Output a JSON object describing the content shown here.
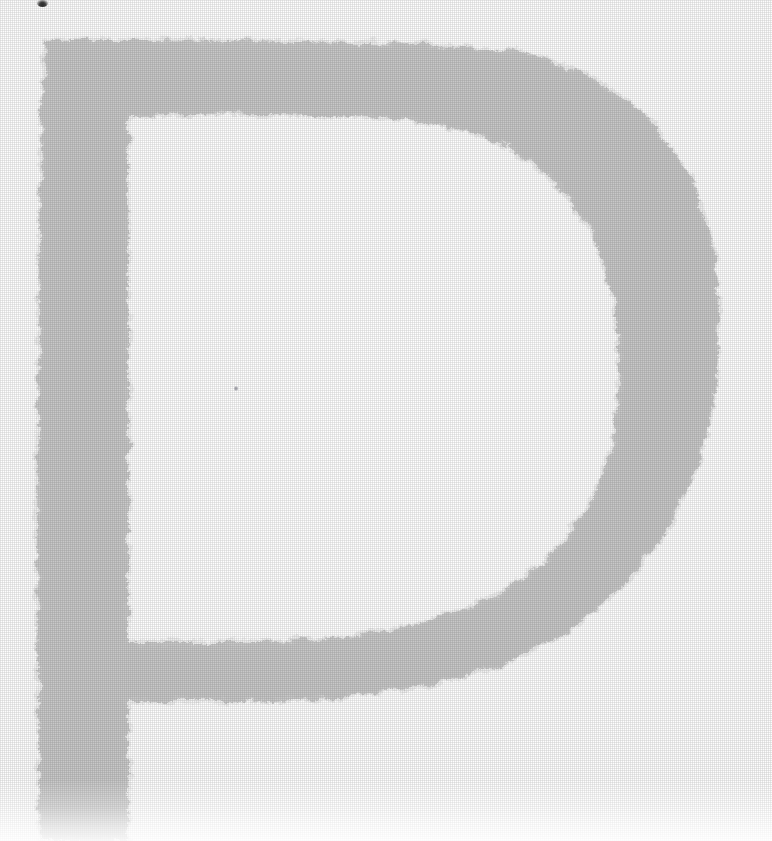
{
  "page": {
    "width": 772,
    "height": 841,
    "background_color": "#ffffff",
    "medium": "scanned printed page",
    "caption": "Large decorative drop-cap letter P printed in light gray with rough, ragged edges on a white page."
  },
  "dropcap": {
    "letter": "P",
    "role": "drop-cap-initial",
    "fill_color": "#c8c8c8",
    "edge_color": "#d4d4d4",
    "texture": "halftone-dither",
    "edge_style": "ragged",
    "bounds": {
      "left": 36,
      "top": 38,
      "right": 722,
      "bottom": 841
    },
    "strokes": {
      "stem_left_edge_x": 40,
      "stem_right_edge_x": 128,
      "stem_top_y": 40,
      "stem_bottom_y": 841,
      "top_bar_inner_y": 116,
      "bowl_right_extent_x": 720,
      "bowl_bottom_y": 700,
      "counter_right_extent_x": 620
    }
  },
  "marks": [
    {
      "id": "speck-top",
      "label": "ink-speck",
      "color": "#2f2f2f",
      "x": 37,
      "y": 0,
      "width": 11,
      "height": 7
    },
    {
      "id": "speck-mid",
      "label": "ink-speck",
      "color": "#9a9aa0",
      "x": 234,
      "y": 386,
      "width": 4,
      "height": 5
    }
  ]
}
